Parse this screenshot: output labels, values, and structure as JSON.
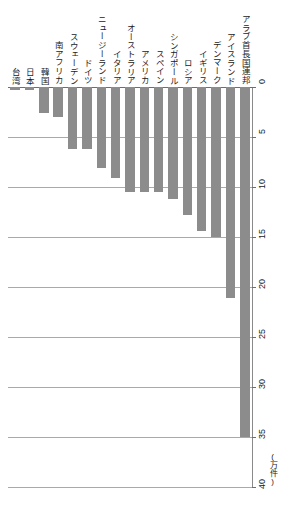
{
  "chart_data": {
    "type": "bar",
    "orientation": "vertical-down",
    "title": "",
    "xlabel": "",
    "ylabel": "",
    "unit_label": "(万件)",
    "ylim": [
      0,
      40
    ],
    "ytick_step": 5,
    "grid": true,
    "legend": "none",
    "bar_color": "#8c8c8c",
    "categories": [
      "台湾",
      "日本",
      "韓国",
      "南アフリカ",
      "スウェーデン",
      "ドイツ",
      "ニュージーランド",
      "イタリア",
      "オーストラリア",
      "アメリカ",
      "スペイン",
      "シンガポール",
      "ロシア",
      "イギリス",
      "デンマーク",
      "アイスランド",
      "アラブ首長国連邦"
    ],
    "values": [
      0.3,
      0.3,
      2.6,
      3.0,
      6.2,
      6.2,
      8.1,
      9.1,
      10.5,
      10.5,
      10.5,
      11.2,
      12.8,
      14.4,
      15.0,
      21.1,
      35.0
    ],
    "ytick_labels": [
      "0",
      "5",
      "10",
      "15",
      "20",
      "25",
      "30",
      "35",
      "40"
    ],
    "ytick_values": [
      0,
      5,
      10,
      15,
      20,
      25,
      30,
      35,
      40
    ]
  }
}
